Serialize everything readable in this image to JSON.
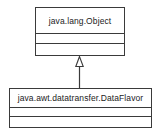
{
  "diagram": {
    "type": "uml-class-diagram",
    "width": 159,
    "height": 135,
    "background_color": "#ffffff",
    "line_color": "#3a3a3a",
    "text_color": "#222222",
    "classes": [
      {
        "id": "object",
        "name": "java.lang.Object",
        "role": "superclass",
        "attributes": [],
        "operations": []
      },
      {
        "id": "dataflavor",
        "name": "java.awt.datatransfer.DataFlavor",
        "role": "subclass",
        "attributes": [],
        "operations": []
      }
    ],
    "relationships": [
      {
        "id": "generalization-1",
        "type": "generalization",
        "arrow": "hollow-triangle",
        "from": "java.awt.datatransfer.DataFlavor",
        "to": "java.lang.Object"
      }
    ]
  }
}
